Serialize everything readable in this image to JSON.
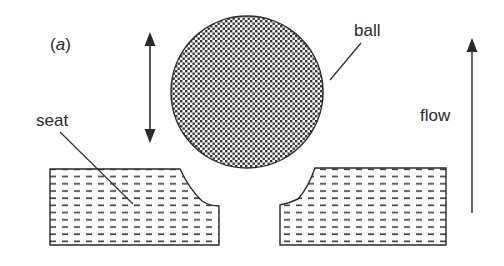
{
  "figure": {
    "panel_label_open": "(",
    "panel_label_letter": "a",
    "panel_label_close": ")",
    "labels": {
      "ball": "ball",
      "seat": "seat",
      "flow": "flow"
    },
    "colors": {
      "stroke": "#2a2a2a",
      "ball_fill": "#6b6b6b",
      "dash": "#3a3a3a",
      "background": "#ffffff"
    }
  }
}
